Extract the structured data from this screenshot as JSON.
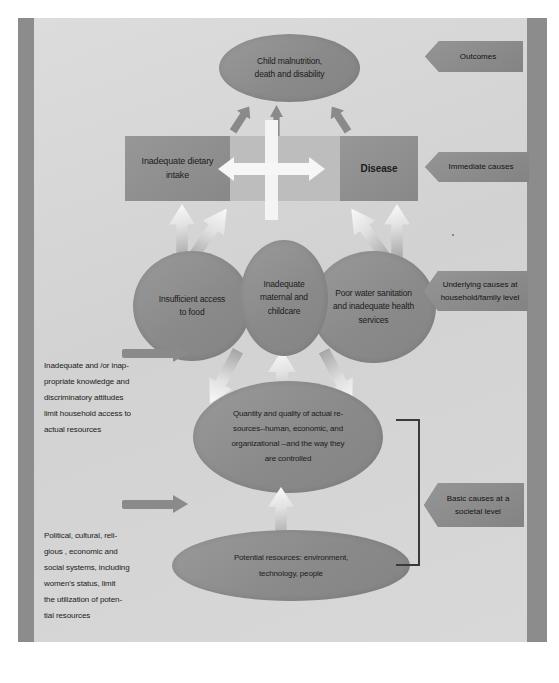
{
  "diagram": {
    "outcome": {
      "label": "Child malnutrition,\ndeath and disability",
      "callout": "Outcomes"
    },
    "immediate": {
      "dietary_intake": "Inadequate dietary\nintake",
      "disease": "Disease",
      "callout": "Immediate causes"
    },
    "underlying": {
      "food_access": "Insufficient access\nto food",
      "maternal_care": "Inadequate\nmaternal and\nchildcare",
      "health_services": "Poor water sanitation\nand inadequate health\nservices",
      "callout": "Underlying causes at\nhousehold/family level"
    },
    "basic": {
      "actual_resources": "Quantity and quality of actual re-\nsources--human, economic, and\norganizational --and the way they\nare controlled",
      "potential_resources": "Potential resources: environment,\ntechnology,  people",
      "callout": "Basic causes at a\nsocietal level"
    },
    "notes": {
      "knowledge": "Inadequate and /or inap-\npropriate knowledge and\ndiscriminatory attitudes\nlimit household access to\nactual resources",
      "political": "Political, cultural, reli-\ngious , economic and\nsocial systems, including\nwomen's status, limit\nthe utilization of poten-\ntial resources"
    },
    "colors": {
      "shape_fill": "#8d8d8d",
      "band_fill": "#bdbdbd",
      "page_background": "#d6d6d6",
      "margin_bar": "#8c8c8c",
      "arrow_outline": "#4d4d4d",
      "text": "#1c1c1c"
    }
  }
}
